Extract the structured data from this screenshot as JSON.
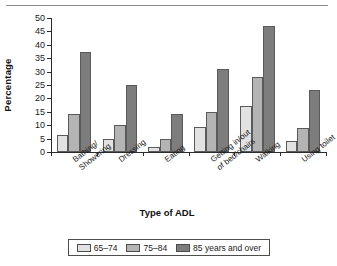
{
  "chart_data": {
    "type": "bar",
    "title": "",
    "xlabel": "Type of ADL",
    "ylabel": "Percentage",
    "ylim": [
      0,
      50
    ],
    "yticks": [
      0,
      5,
      10,
      15,
      20,
      25,
      30,
      35,
      40,
      45,
      50
    ],
    "grid": false,
    "legend_position": "bottom",
    "categories": [
      "Bathing/\nShowering",
      "Dressing",
      "Eating",
      "Getting in/out\nof bed/chairs",
      "Walking",
      "Using toilet"
    ],
    "series": [
      {
        "name": "65–74",
        "color": "#e2e2e2",
        "values": [
          6.5,
          5,
          2,
          9.5,
          17,
          4
        ]
      },
      {
        "name": "75–84",
        "color": "#b4b4b4",
        "values": [
          14,
          10,
          5,
          15,
          28,
          9
        ]
      },
      {
        "name": "85 years and over",
        "color": "#7d7d7d",
        "values": [
          37.5,
          25,
          14,
          31,
          47,
          23
        ]
      }
    ]
  },
  "legend": {
    "items": [
      {
        "label": "65–74"
      },
      {
        "label": "75–84"
      },
      {
        "label": "85 years and over"
      }
    ]
  }
}
